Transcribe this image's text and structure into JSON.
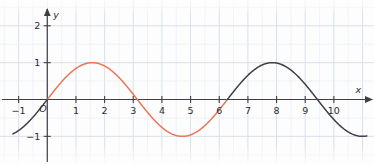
{
  "chart_data": {
    "type": "line",
    "title": "",
    "xlabel": "x",
    "ylabel": "y",
    "origin_label": "O",
    "xlim": [
      -1.65,
      11.4
    ],
    "ylim": [
      -1.75,
      2.7
    ],
    "grid": true,
    "minor_grid_step": 0.5,
    "major_grid_step": 1,
    "legend": "none",
    "x_ticks": [
      {
        "value": -1,
        "label": "−1"
      },
      {
        "value": 1,
        "label": "1"
      },
      {
        "value": 2,
        "label": "2"
      },
      {
        "value": 3,
        "label": "3"
      },
      {
        "value": 4,
        "label": "4"
      },
      {
        "value": 5,
        "label": "5"
      },
      {
        "value": 6,
        "label": "6"
      },
      {
        "value": 7,
        "label": "7"
      },
      {
        "value": 8,
        "label": "8"
      },
      {
        "value": 9,
        "label": "9"
      },
      {
        "value": 10,
        "label": "10"
      }
    ],
    "y_ticks": [
      {
        "value": 2,
        "label": "2"
      },
      {
        "value": 1,
        "label": "1"
      },
      {
        "value": -1,
        "label": "−1"
      }
    ],
    "series": [
      {
        "name": "sine-highlight",
        "color": "#e8775a",
        "x_from": 0,
        "x_to": 6.283185,
        "function": "sin(x)",
        "amplitude": 1,
        "period": 6.283185,
        "phase": 0
      },
      {
        "name": "sine-base-left",
        "color": "#3f3f46",
        "x_from": -1.2,
        "x_to": 0,
        "function": "sin(x)",
        "amplitude": 1,
        "period": 6.283185,
        "phase": 0
      },
      {
        "name": "sine-base-right",
        "color": "#3f3f46",
        "x_from": 6.283185,
        "x_to": 11.15,
        "function": "sin(x)",
        "amplitude": 1,
        "period": 6.283185,
        "phase": 0
      }
    ],
    "key_points": {
      "maxima": [
        {
          "x": 1.5708,
          "y": 1
        },
        {
          "x": 7.854,
          "y": 1
        }
      ],
      "minima": [
        {
          "x": 4.712,
          "y": -1
        }
      ],
      "zeros": [
        0,
        3.1416,
        6.2832
      ]
    },
    "colors": {
      "axis": "#3f3f46",
      "grid_minor": "#e9eef3",
      "grid_major": "#d4dde6",
      "highlight": "#e8775a",
      "curve": "#3f3f46",
      "text": "#2b2b2e",
      "background": "#fdfdfd"
    }
  }
}
